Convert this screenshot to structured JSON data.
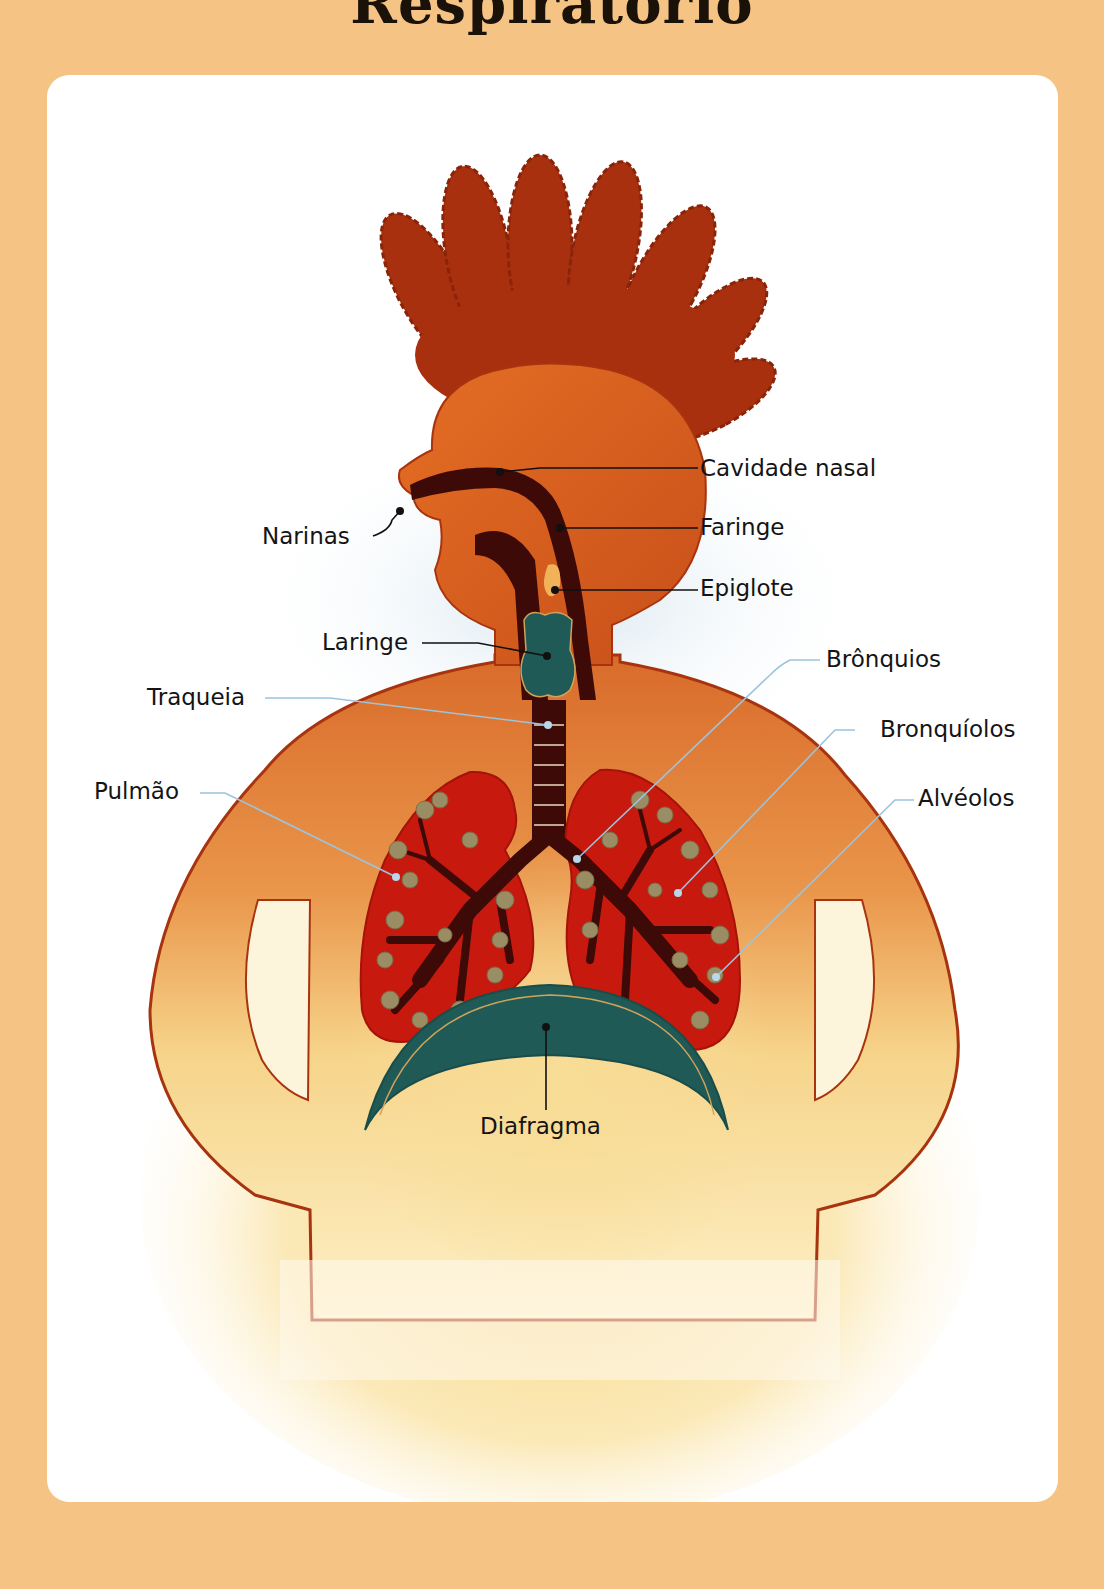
{
  "page": {
    "title": "Respiratório",
    "background_color": "#f5c384",
    "card_color": "#ffffff"
  },
  "diagram": {
    "colors": {
      "body": "#d9611f",
      "hair": "#a8300f",
      "airway": "#3d0a08",
      "lung": "#c8190e",
      "alveoli": "#9a8d63",
      "larynx_diaphragm": "#1f5a56",
      "leader_dark": "#111111",
      "leader_blue": "#9cc3dd"
    },
    "labels": {
      "cavidade_nasal": "Cavidade nasal",
      "narinas": "Narinas",
      "faringe": "Faringe",
      "epiglote": "Epiglote",
      "laringe": "Laringe",
      "traqueia": "Traqueia",
      "bronquios": "Brônquios",
      "bronquiolos": "Bronquíolos",
      "pulmao": "Pulmão",
      "alveolos": "Alvéolos",
      "diafragma": "Diafragma"
    }
  }
}
